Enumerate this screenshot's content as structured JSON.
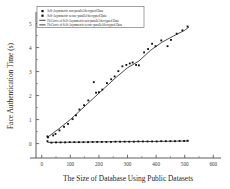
{
  "chart_data": {
    "type": "scatter",
    "title": "",
    "xlabel": "The Size of Database Using Public Datasets",
    "ylabel": "Face Authentication Time (s)",
    "xlim": [
      -20,
      620
    ],
    "ylim": [
      -0.35,
      5.4
    ],
    "xticks": [
      0,
      100,
      200,
      300,
      400,
      500,
      600
    ],
    "yticks": [
      0,
      1,
      2,
      3,
      4,
      5
    ],
    "xticklabels": [
      "0",
      "100",
      "200",
      "300",
      "400",
      "500",
      "600"
    ],
    "yticklabels": [
      "0",
      "1",
      "2",
      "3",
      "4",
      "5"
    ],
    "grid": false,
    "legend_position": "top-left",
    "series": [
      {
        "name": "Self-Asymmetric non-parallel/decrypted Data",
        "marker": "square",
        "type": "scatter",
        "points": [
          [
            20,
            0.3
          ],
          [
            22,
            0.26
          ],
          [
            40,
            0.34
          ],
          [
            48,
            0.4
          ],
          [
            62,
            0.55
          ],
          [
            78,
            0.7
          ],
          [
            92,
            0.82
          ],
          [
            108,
            1.02
          ],
          [
            120,
            1.18
          ],
          [
            132,
            1.42
          ],
          [
            148,
            1.6
          ],
          [
            163,
            1.8
          ],
          [
            182,
            2.56
          ],
          [
            190,
            2.12
          ],
          [
            200,
            2.14
          ],
          [
            212,
            2.25
          ],
          [
            228,
            2.52
          ],
          [
            243,
            2.68
          ],
          [
            255,
            2.8
          ],
          [
            268,
            3.02
          ],
          [
            282,
            3.22
          ],
          [
            296,
            3.28
          ],
          [
            308,
            3.34
          ],
          [
            318,
            3.38
          ],
          [
            330,
            3.28
          ],
          [
            340,
            3.26
          ],
          [
            358,
            3.8
          ],
          [
            372,
            3.94
          ],
          [
            386,
            4.16
          ],
          [
            398,
            4.06
          ],
          [
            418,
            4.3
          ],
          [
            440,
            4.06
          ],
          [
            452,
            4.32
          ],
          [
            472,
            4.58
          ],
          [
            492,
            4.72
          ],
          [
            510,
            4.88
          ]
        ]
      },
      {
        "name": "Self-Asymmetric secure-parallel/decrypted Data",
        "marker": "square",
        "type": "scatter",
        "points": [
          [
            20,
            0.1
          ],
          [
            34,
            0.04
          ],
          [
            50,
            0.05
          ],
          [
            66,
            0.05
          ],
          [
            82,
            0.05
          ],
          [
            98,
            0.06
          ],
          [
            114,
            0.06
          ],
          [
            130,
            0.06
          ],
          [
            146,
            0.06
          ],
          [
            162,
            0.06
          ],
          [
            178,
            0.07
          ],
          [
            194,
            0.07
          ],
          [
            210,
            0.07
          ],
          [
            226,
            0.07
          ],
          [
            242,
            0.07
          ],
          [
            258,
            0.08
          ],
          [
            274,
            0.08
          ],
          [
            290,
            0.08
          ],
          [
            306,
            0.08
          ],
          [
            322,
            0.08
          ],
          [
            338,
            0.09
          ],
          [
            354,
            0.09
          ],
          [
            370,
            0.09
          ],
          [
            386,
            0.09
          ],
          [
            402,
            0.09
          ],
          [
            418,
            0.1
          ],
          [
            434,
            0.1
          ],
          [
            450,
            0.1
          ],
          [
            466,
            0.1
          ],
          [
            482,
            0.11
          ],
          [
            498,
            0.11
          ],
          [
            510,
            0.12
          ]
        ]
      },
      {
        "name": "Fit Curve of Self-Asymmetric non-parallel/decrypted Data",
        "type": "line",
        "points": [
          [
            20,
            0.26
          ],
          [
            60,
            0.62
          ],
          [
            100,
            1.0
          ],
          [
            140,
            1.44
          ],
          [
            180,
            1.88
          ],
          [
            220,
            2.32
          ],
          [
            260,
            2.76
          ],
          [
            300,
            3.16
          ],
          [
            340,
            3.44
          ],
          [
            380,
            3.88
          ],
          [
            420,
            4.22
          ],
          [
            460,
            4.48
          ],
          [
            500,
            4.72
          ],
          [
            515,
            4.86
          ]
        ]
      },
      {
        "name": "Fit Curve of Self-Asymmetric secure-parallel/decrypted Data",
        "type": "line",
        "points": [
          [
            20,
            0.05
          ],
          [
            120,
            0.06
          ],
          [
            260,
            0.08
          ],
          [
            400,
            0.09
          ],
          [
            515,
            0.11
          ]
        ]
      }
    ]
  },
  "legend": {
    "entries": [
      {
        "label": "Self-Asymmetric non-parallel/decrypted Data",
        "kind": "marker"
      },
      {
        "label": "Self-Asymmetric secure-parallel/decrypted Data",
        "kind": "marker"
      },
      {
        "label": "Fit Curve of Self-Asymmetric non-parallel/decrypted Data",
        "kind": "line"
      },
      {
        "label": "Fit Curve of Self-Asymmetric secure-parallel/decrypted Data",
        "kind": "line"
      }
    ]
  },
  "colors": {
    "marker": "#111111",
    "line": "#111111",
    "axis": "#4a4a4a",
    "background": "#ffffff",
    "text": "#262626"
  }
}
